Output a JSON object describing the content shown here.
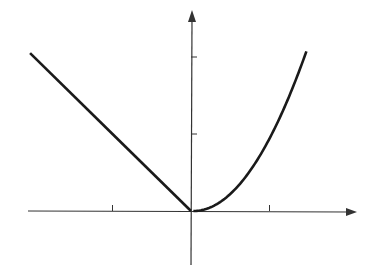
{
  "chart_data": {
    "type": "line",
    "title": "",
    "xlabel": "",
    "ylabel": "",
    "xlim": [
      -2.05,
      2.1
    ],
    "ylim": [
      -1.0,
      2.5
    ],
    "grid": false,
    "legend": null,
    "x_ticks": [
      -1,
      1
    ],
    "y_ticks": [
      1,
      2
    ],
    "tick_labels_shown": false,
    "series": [
      {
        "name": "left branch y = -x (x<0)",
        "x": [
          -2.05,
          -1,
          0
        ],
        "y": [
          2.05,
          1,
          0
        ]
      },
      {
        "name": "right branch y = x^2 (x>=0)",
        "x": [
          0,
          0.25,
          0.5,
          0.75,
          1.0,
          1.25,
          1.45
        ],
        "y": [
          0,
          0.0625,
          0.25,
          0.5625,
          1.0,
          1.5625,
          2.1
        ]
      }
    ]
  },
  "colors": {
    "axis": "#333333",
    "curve": "#1a1a1a",
    "background": "#ffffff"
  }
}
